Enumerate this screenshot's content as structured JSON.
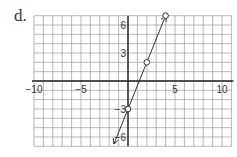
{
  "problem_label": "d.",
  "chart_data": {
    "type": "line",
    "title": "",
    "xlabel": "",
    "ylabel": "",
    "xlim": [
      -10,
      11
    ],
    "ylim": [
      -7,
      7
    ],
    "grid": true,
    "x_ticks": [
      {
        "value": -10,
        "label": "−10"
      },
      {
        "value": -5,
        "label": "−5"
      },
      {
        "value": 5,
        "label": "5"
      },
      {
        "value": 10,
        "label": "10"
      }
    ],
    "y_ticks": [
      {
        "value": 6,
        "label": "6"
      },
      {
        "value": 3,
        "label": "3"
      },
      {
        "value": -3,
        "label": "−3"
      },
      {
        "value": -6,
        "label": "−6"
      }
    ],
    "series": [
      {
        "name": "y = 2.5x - 3",
        "points": [
          {
            "x": 0,
            "y": -3
          },
          {
            "x": 2,
            "y": 2
          },
          {
            "x": 4,
            "y": 7
          }
        ],
        "line_extent": {
          "start": {
            "x": -1.5,
            "y": -6.75
          },
          "end": {
            "x": 4,
            "y": 7
          }
        },
        "arrows": [
          "start",
          "end"
        ],
        "color": "#333333"
      }
    ]
  }
}
